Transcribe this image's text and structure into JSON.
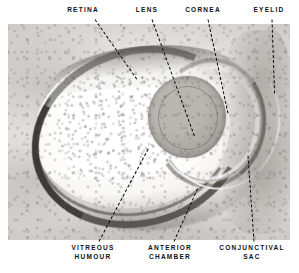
{
  "figure": {
    "type": "histological-section-diagram",
    "subject": "eye"
  },
  "labels": {
    "retina": {
      "text": "RETINA",
      "x": 83,
      "y": 10
    },
    "lens": {
      "text": "LENS",
      "x": 147,
      "y": 10
    },
    "cornea": {
      "text": "CORNEA",
      "x": 203,
      "y": 10
    },
    "eyelid": {
      "text": "EYELID",
      "x": 269,
      "y": 10
    },
    "vitreous_line1": {
      "text": "VITREOUS",
      "x": 93,
      "y": 248
    },
    "vitreous_line2": {
      "text": "HUMOUR",
      "x": 93,
      "y": 257
    },
    "anterior_line1": {
      "text": "ANTERIOR",
      "x": 170,
      "y": 248
    },
    "anterior_line2": {
      "text": "CHAMBER",
      "x": 170,
      "y": 257
    },
    "conjunctival_line1": {
      "text": "CONJUNCTIVAL",
      "x": 252,
      "y": 248
    },
    "conjunctival_line2": {
      "text": "SAC",
      "x": 252,
      "y": 257
    }
  },
  "structures": [
    {
      "name": "retina",
      "label": "RETINA",
      "region": "dark pigmented arc lining the posterior globe"
    },
    {
      "name": "lens",
      "label": "LENS",
      "region": "large grey sphere, anterior-right of globe"
    },
    {
      "name": "cornea",
      "label": "CORNEA",
      "region": "curved band anterior to the lens"
    },
    {
      "name": "eyelid",
      "label": "EYELID",
      "region": "tissue mass at right margin"
    },
    {
      "name": "vitreous-humour",
      "label": "VITREOUS HUMOUR",
      "region": "pale speckled chamber behind the lens"
    },
    {
      "name": "anterior-chamber",
      "label": "ANTERIOR CHAMBER",
      "region": "clear crescent between cornea and lens"
    },
    {
      "name": "conjunctival-sac",
      "label": "CONJUNCTIVAL SAC",
      "region": "cleft between cornea and eyelid"
    }
  ],
  "colors": {
    "ink": "#0c0c0c",
    "plate_background": "#f2f0ed",
    "retina_dark": "#2f2c29",
    "lens_grey": "#a7a49f",
    "page_background": "#ffffff"
  }
}
